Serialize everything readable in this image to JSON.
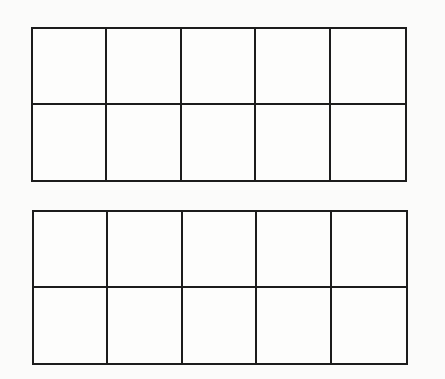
{
  "figure": {
    "line_color": "#1c1c1c",
    "background_color": "#fbfbfa",
    "grids": [
      {
        "name": "top-ten-frame",
        "rows": 2,
        "cols": 5,
        "x": 31,
        "y": 27,
        "width": 376,
        "height": 155,
        "cells_filled": 0
      },
      {
        "name": "bottom-ten-frame",
        "rows": 2,
        "cols": 5,
        "x": 32,
        "y": 210,
        "width": 376,
        "height": 155,
        "cells_filled": 0
      }
    ]
  }
}
